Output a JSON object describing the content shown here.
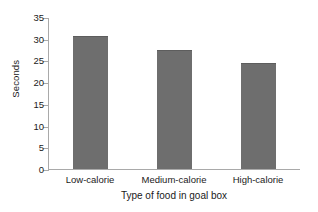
{
  "chart_data": {
    "type": "bar",
    "title": "",
    "categories": [
      "Low-calorie",
      "Medium-calorie",
      "High-calorie"
    ],
    "values": [
      30.7,
      27.5,
      24.4
    ],
    "xlabel": "Type of food in goal box",
    "ylabel": "Seconds",
    "ylim": [
      0,
      35
    ],
    "yticks": [
      0,
      5,
      10,
      15,
      20,
      25,
      30,
      35
    ],
    "ytick_labels": [
      "0",
      "5",
      "10",
      "15",
      "20",
      "25",
      "30",
      "35"
    ],
    "grid": false,
    "legend": false,
    "bar_color": "#6e6e6e",
    "axis_color": "#a9a9a9",
    "text_color": "#1a1a1a",
    "background_color": "#ffffff"
  }
}
